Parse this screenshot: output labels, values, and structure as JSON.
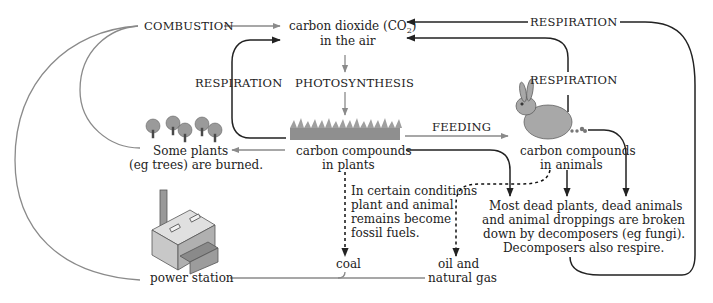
{
  "diagram": {
    "nodes": {
      "combustion": "COMBUSTION",
      "co2_line1": "carbon dioxide (CO",
      "co2_sub": "2",
      "co2_close": ")",
      "co2_line2": "in the air",
      "respiration_top": "RESPIRATION",
      "respiration_left": "RESPIRATION",
      "respiration_right": "RESPIRATION",
      "photosynthesis": "PHOTOSYNTHESIS",
      "feeding": "FEEDING",
      "plants_line1": "carbon compounds",
      "plants_line2": "in plants",
      "animals_line1": "carbon compounds",
      "animals_line2": "in animals",
      "burned_line1": "Some plants",
      "burned_line2": "(eg trees) are burned.",
      "fossil_line1": "In certain conditions",
      "fossil_line2": "plant and animal",
      "fossil_line3": "remains become",
      "fossil_line4": "fossil fuels.",
      "decomp_line1": "Most dead plants, dead animals",
      "decomp_line2": "and animal droppings are broken",
      "decomp_line3": "down by decomposers (eg fungi).",
      "decomp_line4": "Decomposers also respire.",
      "coal": "coal",
      "oil_line1": "oil and",
      "oil_line2": "natural gas",
      "power_station": "power station"
    },
    "icons": [
      "trees-icon",
      "grass-icon",
      "rabbit-icon",
      "droppings-icon",
      "factory-icon"
    ],
    "colors": {
      "text": "#222222",
      "gray_arrow": "#8a8a8a",
      "dark_arrow": "#222222",
      "grass": "#8f8f8f",
      "tree": "#9a9a9a"
    }
  }
}
